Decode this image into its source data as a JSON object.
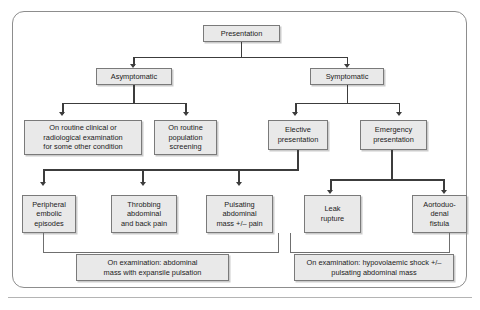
{
  "diagram": {
    "type": "flowchart",
    "colors": {
      "node_fill": "#e9e9e9",
      "node_border": "#7a7a7a",
      "connector": "#3c3c3c",
      "frame_border": "#8d8d8d",
      "text": "#1b1b1b"
    },
    "nodes": {
      "root": "Presentation",
      "asymptomatic": "Asymptomatic",
      "symptomatic": "Symptomatic",
      "routine_clinical": "On routine clinical or\nradiological examination\nfor some other condition",
      "routine_screening": "On routine\npopulation\nscreening",
      "elective": "Elective\npresentation",
      "emergency": "Emergency\npresentation",
      "peripheral_embolic": "Peripheral\nembolic\nepisodes",
      "throbbing_pain": "Throbbing\nabdominal\nand back pain",
      "pulsating_mass": "Pulsating\nabdominal\nmass +/– pain",
      "leak_rupture": "Leak\nrupture",
      "aortoduodenal": "Aortoduo-\ndenal\nfistula",
      "exam_left": "On examination: abdominal\nmass with expansile pulsation",
      "exam_right": "On examination: hypovolaemic shock +/–\npulsating abdominal mass"
    },
    "edges": [
      {
        "from": "root",
        "to": "asymptomatic"
      },
      {
        "from": "root",
        "to": "symptomatic"
      },
      {
        "from": "asymptomatic",
        "to": "routine_clinical"
      },
      {
        "from": "asymptomatic",
        "to": "routine_screening"
      },
      {
        "from": "symptomatic",
        "to": "elective"
      },
      {
        "from": "symptomatic",
        "to": "emergency"
      },
      {
        "from": "elective",
        "to": "peripheral_embolic"
      },
      {
        "from": "elective",
        "to": "throbbing_pain"
      },
      {
        "from": "elective",
        "to": "pulsating_mass"
      },
      {
        "from": "emergency",
        "to": "leak_rupture"
      },
      {
        "from": "emergency",
        "to": "aortoduodenal"
      },
      {
        "from": "peripheral_embolic",
        "to": "exam_left"
      },
      {
        "from": "throbbing_pain",
        "to": "exam_left"
      },
      {
        "from": "pulsating_mass",
        "to": "exam_left"
      },
      {
        "from": "leak_rupture",
        "to": "exam_right"
      },
      {
        "from": "aortoduodenal",
        "to": "exam_right"
      }
    ]
  }
}
